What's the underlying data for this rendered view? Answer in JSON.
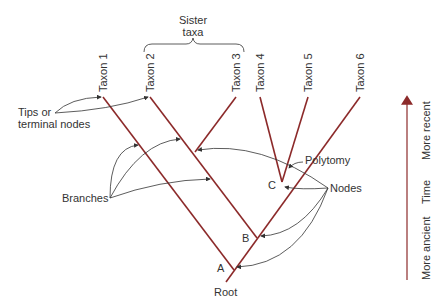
{
  "diagram": {
    "type": "phylogenetic-tree",
    "colors": {
      "branch": "#8c2a2a",
      "text": "#333333",
      "arrow": "#333333"
    },
    "taxa": [
      {
        "label": "Taxon 1",
        "x": 103
      },
      {
        "label": "Taxon 2",
        "x": 150
      },
      {
        "label": "Taxon 3",
        "x": 236
      },
      {
        "label": "Taxon 4",
        "x": 260
      },
      {
        "label": "Taxon 5",
        "x": 308
      },
      {
        "label": "Taxon 6",
        "x": 360
      }
    ],
    "sister_taxa": {
      "line1": "Sister",
      "line2": "taxa"
    },
    "nodes": {
      "a": "A",
      "b": "B",
      "c": "C"
    },
    "root_label": "Root",
    "annotations": {
      "tips_line1": "Tips or",
      "tips_line2": "terminal nodes",
      "branches": "Branches",
      "nodes": "Nodes",
      "polytomy": "Polytomy"
    },
    "time_axis": {
      "label_recent": "More recent",
      "label_time": "Time",
      "label_ancient": "More ancient"
    }
  }
}
